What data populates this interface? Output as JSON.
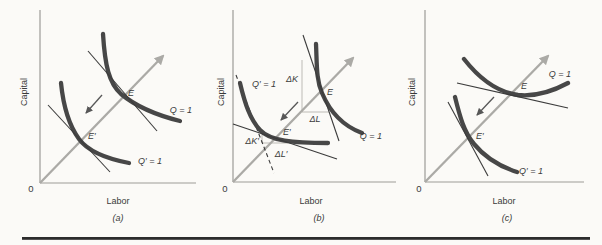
{
  "colors": {
    "background": "#fbfaf7",
    "curve": "#474747",
    "ray": "#abaaa6",
    "axis": "#9d9b97",
    "tangent_line": "#3b3b3b",
    "construction_line": "#bdbbb6",
    "shift_arrow": "#575757",
    "text": "#3a3a3a",
    "bottom_rule": "#2c2c2c"
  },
  "panels": [
    {
      "caption": "(a)",
      "y_axis_label": "Capital",
      "x_axis_label": "Labor",
      "origin_label": "0",
      "isoquant_label": "Q = 1",
      "new_isoquant_label": "Q′ = 1",
      "point_label": "E",
      "new_point_label": "E′"
    },
    {
      "caption": "(b)",
      "y_axis_label": "Capital",
      "x_axis_label": "Labor",
      "origin_label": "0",
      "isoquant_label": "Q = 1",
      "new_isoquant_label": "Q′ = 1",
      "point_label": "E",
      "new_point_label": "E′",
      "delta_k_label": "ΔK",
      "delta_l_label": "ΔL",
      "delta_k_prime_label": "ΔK′",
      "delta_l_prime_label": "ΔL′"
    },
    {
      "caption": "(c)",
      "y_axis_label": "Capital",
      "x_axis_label": "Labor",
      "origin_label": "0",
      "isoquant_label": "Q = 1",
      "new_isoquant_label": "Q′ = 1",
      "point_label": "E",
      "new_point_label": "E′"
    }
  ]
}
